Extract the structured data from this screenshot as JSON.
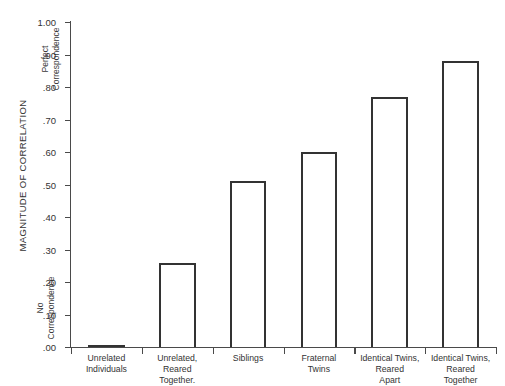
{
  "chart_data": {
    "type": "bar",
    "title": "",
    "subtitle": "",
    "xlabel": "",
    "ylabel": "MAGNITUDE OF CORRELATION",
    "ylim": [
      0.0,
      1.0
    ],
    "grid": false,
    "legend_position": "none",
    "categories": [
      "Unrelated Individuals",
      "Unrelated, Reared Together.",
      "Siblings",
      "Fraternal Twins",
      "Identical Twins, Reared Apart",
      "Identical Twins, Reared Together"
    ],
    "category_lines": [
      [
        "Unrelated",
        "Individuals"
      ],
      [
        "Unrelated,",
        "Reared",
        "Together."
      ],
      [
        "Siblings"
      ],
      [
        "Fraternal",
        "Twins"
      ],
      [
        "Identical Twins,",
        "Reared",
        "Apart"
      ],
      [
        "Identical Twins,",
        "Reared",
        "Together"
      ]
    ],
    "values": [
      0.0,
      0.26,
      0.51,
      0.6,
      0.77,
      0.88
    ],
    "ytick_values": [
      1.0,
      0.9,
      0.8,
      0.7,
      0.6,
      0.5,
      0.4,
      0.3,
      0.2,
      0.1,
      0.0
    ],
    "ytick_labels": [
      "1.00",
      ".90",
      ".80",
      ".70",
      ".60",
      ".50",
      ".40",
      ".30",
      ".20",
      ".10",
      ".00"
    ],
    "annotations": [
      {
        "name": "perfect-correspondence",
        "lines": [
          "Perfect",
          "Correspondence"
        ],
        "at_value": 1.0
      },
      {
        "name": "no-correspondence",
        "lines": [
          "No",
          "Correspondence"
        ],
        "at_value": 0.1
      }
    ],
    "colors": {
      "bar_fill": "#ffffff",
      "bar_stroke": "#333333",
      "axis": "#4a4a4a",
      "text": "#333333",
      "background": "#ffffff"
    }
  }
}
